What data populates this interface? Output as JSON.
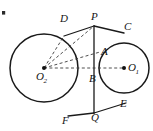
{
  "figure": {
    "type": "geometry-diagram",
    "width": 153,
    "height": 131,
    "background_color": "#ffffff",
    "stroke_color": "#1a1a1a",
    "dashed_color": "#3a3a3a"
  },
  "circles": [
    {
      "name": "large-circle",
      "center_label": "O",
      "center_subscript": "2",
      "cx": 44,
      "cy": 68,
      "r": 34
    },
    {
      "name": "small-circle",
      "center_label": "O",
      "center_subscript": "1",
      "cx": 124,
      "cy": 68,
      "r": 25
    }
  ],
  "points": [
    {
      "id": "D",
      "label": "D",
      "x": 64,
      "y": 36,
      "label_x": 60,
      "label_y": 13
    },
    {
      "id": "P",
      "label": "P",
      "x": 94,
      "y": 26,
      "label_x": 91,
      "label_y": 11
    },
    {
      "id": "C",
      "label": "C",
      "x": 123,
      "y": 33,
      "label_x": 124,
      "label_y": 21
    },
    {
      "id": "A",
      "label": "A",
      "x": 100,
      "y": 52,
      "label_x": 101,
      "label_y": 46
    },
    {
      "id": "B",
      "label": "B",
      "x": 96,
      "y": 77,
      "label_x": 89,
      "label_y": 73
    },
    {
      "id": "O1",
      "label": "O",
      "x": 124,
      "y": 68,
      "label_x": 128,
      "label_y": 62,
      "subscript": "1"
    },
    {
      "id": "O2",
      "label": "O",
      "x": 44,
      "y": 68,
      "label_x": 38,
      "label_y": 71,
      "subscript": "2"
    },
    {
      "id": "E",
      "label": "E",
      "x": 125,
      "y": 104,
      "label_x": 122,
      "label_y": 100
    },
    {
      "id": "Q",
      "label": "Q",
      "x": 94,
      "y": 113,
      "label_x": 91,
      "label_y": 112
    },
    {
      "id": "F",
      "label": "F",
      "x": 70,
      "y": 114,
      "label_x": 63,
      "label_y": 116
    }
  ],
  "solid_segments": [
    {
      "name": "segment-D-P",
      "from": "D",
      "to": "P"
    },
    {
      "name": "segment-P-C",
      "from": "P",
      "to": "C"
    },
    {
      "name": "segment-P-Q",
      "from": "P",
      "to": "Q"
    },
    {
      "name": "segment-Q-E",
      "from": "Q",
      "to": "E"
    },
    {
      "name": "segment-F-Q",
      "from": "F",
      "to": "Q"
    }
  ],
  "dashed_segments": [
    {
      "name": "radius-O2-D",
      "from": "O2",
      "to": "D"
    },
    {
      "name": "radius-O2-P",
      "from": "O2",
      "to": "P"
    },
    {
      "name": "radius-O2-A",
      "from": "O2",
      "to": "A"
    },
    {
      "name": "axis-O2-O1",
      "from": "O2",
      "to": "O1"
    }
  ]
}
